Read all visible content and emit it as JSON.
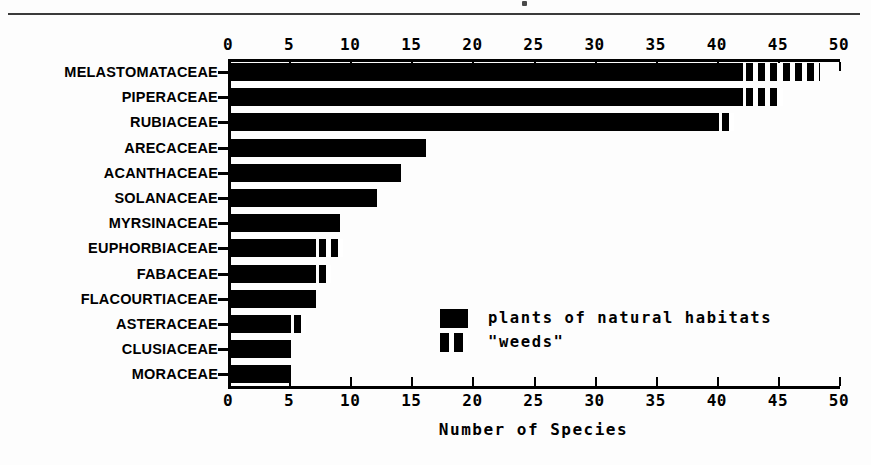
{
  "figure": {
    "background_color": "#ffffff",
    "ink_color": "#000000",
    "top_rule": true
  },
  "chart_data": {
    "type": "bar",
    "orientation": "horizontal",
    "title": "",
    "xlabel": "Number of Species",
    "ylabel": "",
    "xlim": [
      0,
      50
    ],
    "xticks": [
      0,
      5,
      10,
      15,
      20,
      25,
      30,
      35,
      40,
      45,
      50
    ],
    "xticklabels": [
      "0",
      "5",
      "10",
      "15",
      "20",
      "25",
      "30",
      "35",
      "40",
      "45",
      "50"
    ],
    "grid": false,
    "axis_top_ticks": true,
    "axis_bottom_ticks": true,
    "stacked": true,
    "categories": [
      "MELASTOMATACEAE",
      "PIPERACEAE",
      "RUBIACEAE",
      "ARECACEAE",
      "ACANTHACEAE",
      "SOLANACEAE",
      "MYRSINACEAE",
      "EUPHORBIACEAE",
      "FABACEAE",
      "FLACOURTIACEAE",
      "ASTERACEAE",
      "CLUSIACEAE",
      "MORACEAE"
    ],
    "series": [
      {
        "name": "plants of natural habitats",
        "fill": "solid",
        "color": "#000000",
        "values": [
          42,
          42,
          40,
          16,
          14,
          12,
          9,
          7,
          7,
          7,
          5,
          5,
          5
        ]
      },
      {
        "name": "\"weeds\"",
        "fill": "striped",
        "color": "#000000",
        "values": [
          6,
          3,
          1,
          0,
          0,
          0,
          0,
          2,
          1,
          0,
          1,
          0,
          0
        ]
      }
    ],
    "totals": [
      48,
      45,
      41,
      16,
      14,
      12,
      9,
      9,
      8,
      7,
      6,
      5,
      5
    ],
    "legend": {
      "position": "inside-lower-right",
      "entries": [
        {
          "label": "plants of natural habitats",
          "fill": "solid"
        },
        {
          "label": "\"weeds\"",
          "fill": "striped"
        }
      ]
    }
  }
}
